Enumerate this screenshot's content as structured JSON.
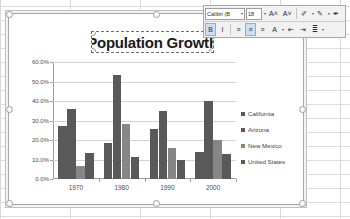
{
  "app": {
    "name": "spreadsheet-chart-editor"
  },
  "mini_toolbar": {
    "font_name": "Calibri (B",
    "font_size": "18",
    "buttons": [
      {
        "name": "grow-font-icon",
        "label": "A˄"
      },
      {
        "name": "shrink-font-icon",
        "label": "A˅"
      },
      {
        "name": "highlight-color-icon",
        "label": "✐"
      },
      {
        "name": "font-color-icon",
        "label": "✎"
      },
      {
        "name": "format-painter-icon",
        "label": "✒"
      },
      {
        "name": "bold-button",
        "label": "B"
      },
      {
        "name": "italic-button",
        "label": "I"
      },
      {
        "name": "align-left-button",
        "label": "≡"
      },
      {
        "name": "align-center-button",
        "label": "≡"
      },
      {
        "name": "align-right-button",
        "label": "≡"
      },
      {
        "name": "font-settings-icon",
        "label": "A"
      },
      {
        "name": "decrease-indent-icon",
        "label": "⇤"
      },
      {
        "name": "increase-indent-icon",
        "label": "⇥"
      },
      {
        "name": "bullets-icon",
        "label": "≣"
      }
    ],
    "caret": "▾"
  },
  "chart_data": {
    "type": "bar",
    "title": "Population Growth",
    "xlabel": "",
    "ylabel": "",
    "categories": [
      "1970",
      "1980",
      "1990",
      "2000"
    ],
    "ylim": [
      0,
      0.6
    ],
    "ytick_labels": [
      "60.0%",
      "50.0%",
      "40.0%",
      "30.0%",
      "20.0%",
      "10.0%",
      "0.0%"
    ],
    "ytick_values": [
      0.6,
      0.5,
      0.4,
      0.3,
      0.2,
      0.1,
      0.0
    ],
    "grid": true,
    "legend_position": "right",
    "series": [
      {
        "name": "California",
        "color": "#595959",
        "values": [
          0.27,
          0.185,
          0.258,
          0.136
        ]
      },
      {
        "name": "Arizona",
        "color": "#595959",
        "values": [
          0.36,
          0.535,
          0.348,
          0.4
        ]
      },
      {
        "name": "New Mexico",
        "color": "#868686",
        "values": [
          0.065,
          0.28,
          0.16,
          0.2
        ]
      },
      {
        "name": "United States",
        "color": "#595959",
        "values": [
          0.132,
          0.114,
          0.1,
          0.13
        ]
      }
    ]
  },
  "colors": {
    "series_dark": "#595959",
    "series_mid": "#868686",
    "grid": "#d3d3d3",
    "axis": "#9c9c9c"
  }
}
